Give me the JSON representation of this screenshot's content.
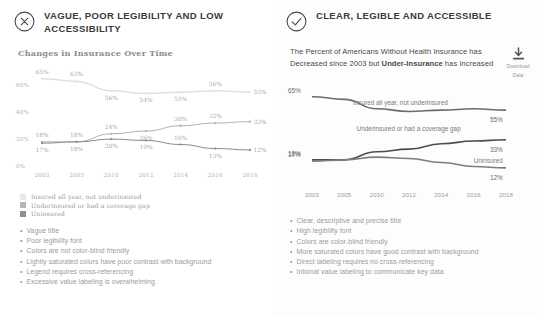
{
  "left": {
    "header": {
      "icon": "x-circle-icon",
      "title": "VAGUE, POOR LEGIBILITY AND LOW ACCESSIBILITY"
    },
    "chart_title": "Changes in Insurance Over Time",
    "legend": [
      {
        "label": "Insured all year, not underinsured",
        "color": "#e8e8e8"
      },
      {
        "label": "Underinsured or had a coverage gap",
        "color": "#b5b5b5"
      },
      {
        "label": "Uninsured",
        "color": "#8f8f8f"
      }
    ],
    "bullets": [
      "Vague title",
      "Poor legibility font",
      "Colors are not color-blind friendly",
      "Lightly saturated colors have poor contrast with background",
      "Legend requires cross-referencing",
      "Excessive value labeling is overwhelming"
    ]
  },
  "right": {
    "header": {
      "icon": "check-circle-icon",
      "title": "CLEAR, LEGIBLE AND ACCESSIBLE"
    },
    "subtitle_part1": "The Percent of Americans Without Health Insurance has Decreased since 2003 but ",
    "subtitle_emphasis": "Under-Insurance",
    "subtitle_part2": " has Increased",
    "download": {
      "icon": "download-icon",
      "line1": "Download",
      "line2": "Data"
    },
    "bullets": [
      "Clear, descriptive and precise title",
      "High legibility font",
      "Colors are color-blind friendly",
      "More saturated colors have good contrast with background",
      "Direct labeling requires no cross-referencing",
      "Intional value labeling to communicate key data"
    ]
  },
  "chart_data": [
    {
      "id": "bad-chart",
      "type": "line",
      "title": "Changes in Insurance Over Time",
      "xlabel": "",
      "ylabel": "",
      "ylim": [
        0,
        70
      ],
      "yticks": [
        "0%",
        "20%",
        "40%",
        "60%"
      ],
      "ytick_values": [
        0,
        20,
        40,
        60
      ],
      "grid": false,
      "legend_position": "below",
      "value_labels": "all points",
      "categories": [
        "2003",
        "2005",
        "2010",
        "2012",
        "2014",
        "2016",
        "2018"
      ],
      "series": [
        {
          "name": "Insured all year, not underinsured",
          "color": "#e0e0e0",
          "values": [
            65,
            63,
            56,
            54,
            55,
            56,
            55
          ],
          "labels": [
            "65%",
            "63%",
            "56%",
            "54%",
            "55%",
            "56%",
            "55%"
          ]
        },
        {
          "name": "Underinsured or had a coverage gap",
          "color": "#b0b0b0",
          "values": [
            18,
            18,
            24,
            26,
            30,
            32,
            33
          ],
          "labels": [
            "18%",
            "18%",
            "24%",
            "26%",
            "30%",
            "32%",
            "33%"
          ]
        },
        {
          "name": "Uninsured",
          "color": "#8a8a8a",
          "values": [
            17,
            18,
            20,
            19,
            16,
            13,
            12
          ],
          "labels": [
            "17%",
            "18%",
            "20%",
            "19%",
            "16%",
            "13%",
            "12%"
          ]
        }
      ]
    },
    {
      "id": "good-chart",
      "type": "line",
      "title": "The Percent of Americans Without Health Insurance has Decreased since 2003 but Under-Insurance has Increased",
      "xlabel": "",
      "ylabel": "",
      "ylim": [
        0,
        70
      ],
      "grid": false,
      "legend_position": "direct-labeling",
      "value_labels": "endpoints only",
      "categories": [
        "2003",
        "2005",
        "2010",
        "2012",
        "2014",
        "2016",
        "2018"
      ],
      "series": [
        {
          "name": "Insured all year, not underinsured",
          "color": "#6b6b6b",
          "values": [
            65,
            63,
            56,
            54,
            55,
            56,
            55
          ],
          "start_label": "65%",
          "end_label": "55%"
        },
        {
          "name": "Underinsured or had a coverage gap",
          "color": "#4d4d4d",
          "values": [
            18,
            18,
            24,
            26,
            30,
            32,
            33
          ],
          "start_label": "18%",
          "end_label": "33%"
        },
        {
          "name": "Uninsured",
          "color": "#7d7d7d",
          "values": [
            17,
            18,
            20,
            19,
            16,
            13,
            12
          ],
          "start_label": "17%",
          "end_label": "12%"
        }
      ]
    }
  ]
}
